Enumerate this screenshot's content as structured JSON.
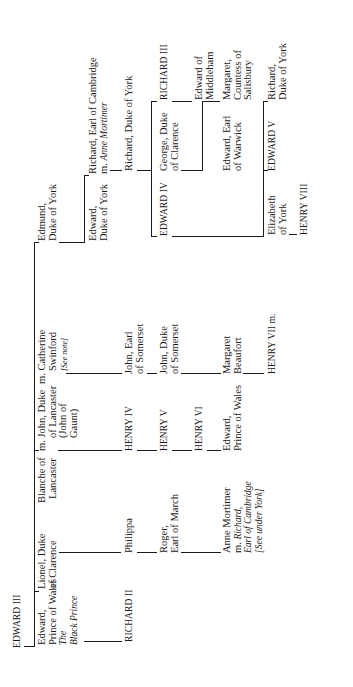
{
  "diagram": {
    "type": "genealogy-tree",
    "orientation": "rotated-90-ccw",
    "root": {
      "name": "EDWARD III"
    },
    "generation1": {
      "edward_black_prince": {
        "line1": "Edward,",
        "line2": "Prince of Wales",
        "line3": "The",
        "line4": "Black Prince"
      },
      "lionel": {
        "line1": "Lionel, Duke",
        "line2": "of Clarence"
      },
      "blanche": {
        "line1": "Blanche of",
        "line2": "Lancaster"
      },
      "john_of_gaunt": {
        "line1": "m. John, Duke",
        "line2": "of Lancaster",
        "line3": "(John of",
        "line4": "Gaunt)"
      },
      "catherine": {
        "line1": "m. Catherine",
        "line2": "Swinford",
        "note": "[See note]"
      },
      "edmund": {
        "line1": "Edmund,",
        "line2": "Duke of York"
      }
    },
    "generation2": {
      "edward_york": {
        "line1": "Edward,",
        "line2": "Duke of York"
      },
      "richard_cambridge": {
        "line1": "Richard, Earl of Cambridge",
        "line2_prefix": "m. ",
        "line2_italic": "Anne Mortimer"
      }
    },
    "generation3": {
      "richard_ii": {
        "name": "RICHARD II"
      },
      "philippa": {
        "name": "Philippa"
      },
      "henry_iv": {
        "name": "HENRY IV"
      },
      "john_earl_somerset": {
        "line1": "John, Earl",
        "line2": "of Somerset"
      },
      "richard_duke_york": {
        "name": "Richard, Duke of York"
      }
    },
    "generation4": {
      "roger": {
        "line1": "Roger,",
        "line2": "Earl of March"
      },
      "henry_v": {
        "name": "HENRY V"
      },
      "john_duke_somerset": {
        "line1": "John, Duke",
        "line2": "of Somerset"
      },
      "edward_iv": {
        "name": "EDWARD IV"
      },
      "george": {
        "line1": "George, Duke",
        "line2": "of Clarence"
      },
      "richard_iii": {
        "name": "RICHARD III"
      }
    },
    "generation5": {
      "henry_vi": {
        "name": "HENRY VI"
      },
      "edward_middleham": {
        "line1": "Edward of",
        "line2": "Middleham"
      }
    },
    "generation6": {
      "anne_mortimer": {
        "line1": "Anne Mortimer",
        "line2_prefix": "m. ",
        "line2_italic": "Richard,",
        "line3": "Earl of Cambridge",
        "line4": "[See under York]"
      },
      "edward_prince_wales": {
        "line1": "Edward,",
        "line2": "Prince of Wales"
      },
      "margaret_beaufort": {
        "line1": "Margaret",
        "line2": "Beaufort"
      },
      "edward_warwick": {
        "line1": "Edward, Earl",
        "line2": "of Warwick"
      },
      "margaret_salisbury": {
        "line1": "Margaret,",
        "line2": "Countess of",
        "line3": "Salisbury"
      }
    },
    "generation7": {
      "henry_vii": {
        "name": "HENRY VII m."
      },
      "elizabeth_york": {
        "line1": "Elizabeth",
        "line2": "of York"
      },
      "edward_v": {
        "name": "EDWARD V"
      },
      "richard_duke_york_2": {
        "line1": "Richard,",
        "line2": "Duke of York"
      }
    },
    "generation8": {
      "henry_viii": {
        "name": "HENRY VIII"
      }
    }
  }
}
